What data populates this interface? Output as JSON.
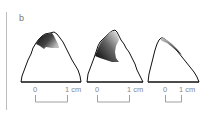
{
  "panel": {
    "label": "b"
  },
  "specimens": [
    {
      "id": 1,
      "shading": "dark wear facet near apex"
    },
    {
      "id": 2,
      "shading": "large dark wear facet on left apex"
    },
    {
      "id": 3,
      "shading": "narrow dark edge along right side"
    }
  ],
  "scale_bars": [
    {
      "start_label": "0",
      "end_label": "1 cm"
    },
    {
      "start_label": "0",
      "end_label": "1 cm"
    },
    {
      "start_label": "0",
      "end_label": "1 cm"
    }
  ],
  "colors": {
    "outline": "#111111",
    "scale": "#888888",
    "divider": "#bdbdbd"
  }
}
